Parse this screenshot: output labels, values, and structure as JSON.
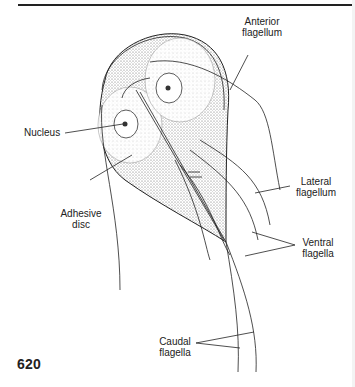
{
  "figure": {
    "labels": {
      "anterior_flagellum": [
        "Anterior",
        "flagellum"
      ],
      "nucleus": [
        "Nucleus"
      ],
      "adhesive_disc": [
        "Adhesive",
        "disc"
      ],
      "lateral_flagellum": [
        "Lateral",
        "flagellum"
      ],
      "ventral_flagella": [
        "Ventral",
        "flagella"
      ],
      "caudal_flagella": [
        "Caudal",
        "flagella"
      ]
    }
  },
  "page": {
    "number": "620"
  },
  "colors": {
    "ink": "#222222",
    "stipple": "#bdbdbd",
    "background": "#ffffff"
  }
}
